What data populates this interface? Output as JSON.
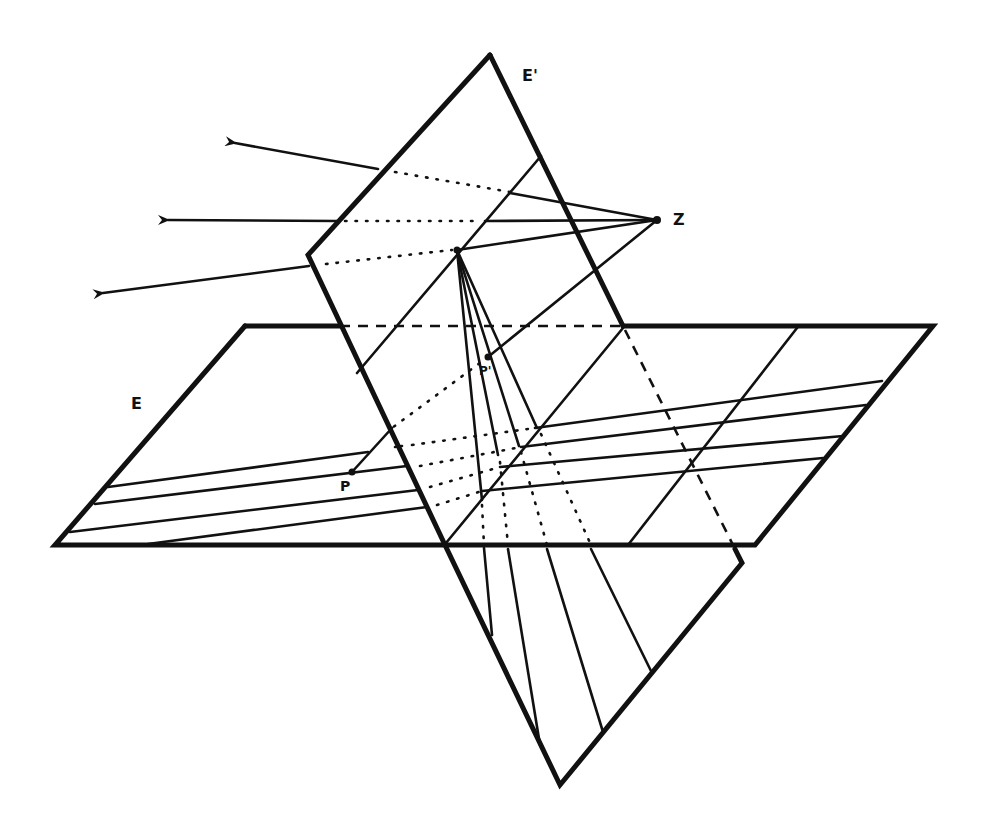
{
  "diagram": {
    "labels": {
      "plane_E": "E",
      "plane_E_prime": "E'",
      "center": "Z",
      "point": "P",
      "image_point": "P'"
    },
    "colors": {
      "ink": "#111111",
      "background": "#ffffff"
    },
    "elements": {
      "plane_E": "horizontal parallelogram with four parallel lines",
      "plane_E_prime": "tilted picture plane intersecting E",
      "projection_rays": 3,
      "fan_lines_from_vanishing_point": 4
    }
  }
}
